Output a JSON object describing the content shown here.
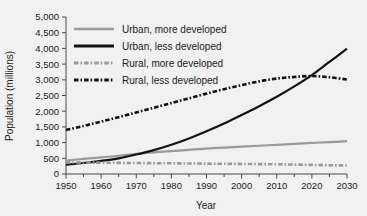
{
  "chart_data": {
    "type": "line",
    "title": "",
    "xlabel": "Year",
    "ylabel": "Population (millions)",
    "xlim": [
      1950,
      2030
    ],
    "ylim": [
      0,
      5000
    ],
    "grid": false,
    "legend_position": "upper-left-inside",
    "xticks": [
      1950,
      1960,
      1970,
      1980,
      1990,
      2000,
      2010,
      2020,
      2030
    ],
    "xtick_labels": [
      "1950",
      "1960",
      "1970",
      "1980",
      "1990",
      "2000",
      "2010",
      "2020",
      "2030"
    ],
    "xminor_step": 5,
    "yticks": [
      0,
      500,
      1000,
      1500,
      2000,
      2500,
      3000,
      3500,
      4000,
      4500,
      5000
    ],
    "ytick_labels": [
      "0",
      "500",
      "1,000",
      "1,500",
      "2,000",
      "2,500",
      "3,000",
      "3,500",
      "4,000",
      "4,500",
      "5,000"
    ],
    "x": [
      1950,
      1955,
      1960,
      1965,
      1970,
      1975,
      1980,
      1985,
      1990,
      1995,
      2000,
      2005,
      2010,
      2015,
      2020,
      2025,
      2030
    ],
    "series": [
      {
        "name": "Urban, more developed",
        "color": "#9a9a9a",
        "style": "solid",
        "values": [
          430,
          480,
          530,
          580,
          640,
          690,
          730,
          770,
          810,
          840,
          870,
          900,
          930,
          960,
          990,
          1015,
          1045
        ]
      },
      {
        "name": "Urban, less developed",
        "color": "#121212",
        "style": "solid",
        "values": [
          300,
          350,
          420,
          500,
          620,
          760,
          930,
          1130,
          1360,
          1610,
          1880,
          2160,
          2460,
          2790,
          3150,
          3570,
          3990
        ]
      },
      {
        "name": "Rural, more developed",
        "color": "#9a9a9a",
        "style": "dashdot",
        "values": [
          370,
          365,
          360,
          355,
          350,
          345,
          340,
          335,
          330,
          325,
          320,
          315,
          310,
          300,
          290,
          280,
          270
        ]
      },
      {
        "name": "Rural, less developed",
        "color": "#121212",
        "style": "dashdot",
        "values": [
          1400,
          1530,
          1670,
          1810,
          1960,
          2110,
          2260,
          2410,
          2560,
          2700,
          2830,
          2950,
          3040,
          3090,
          3120,
          3080,
          3010
        ]
      }
    ]
  },
  "legend": {
    "items": [
      {
        "label": "Urban, more developed"
      },
      {
        "label": "Urban, less developed"
      },
      {
        "label": "Rural, more developed"
      },
      {
        "label": "Rural, less developed"
      }
    ]
  }
}
